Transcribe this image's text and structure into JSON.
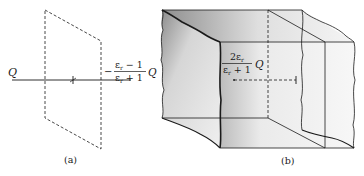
{
  "figure": {
    "panel_a": {
      "caption": "(a)",
      "charge_label": "Q",
      "image_charge": {
        "sign": "−",
        "numerator": "ε",
        "numerator_sub": "r",
        "numerator_tail": " − 1",
        "denominator": "ε",
        "denominator_sub": "r",
        "denominator_tail": " + 1",
        "suffix": "Q"
      }
    },
    "panel_b": {
      "caption": "(b)",
      "transmitted_charge": {
        "numerator": "2ε",
        "numerator_sub": "r",
        "denominator": "ε",
        "denominator_sub": "r",
        "denominator_tail": " + 1",
        "suffix": "Q"
      }
    },
    "colors": {
      "ink": "#1a1a1a",
      "shade_dark": "#9a9a9a",
      "shade_light": "#e4e4e4"
    }
  }
}
